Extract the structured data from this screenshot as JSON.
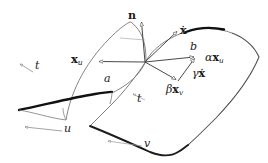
{
  "figure": {
    "kind": "geometry-diagram",
    "background_color": "#ffffff",
    "ink_color": "#1a1a1a",
    "thin_stroke_color": "#555555",
    "bold_curve_color": "#000000"
  },
  "labels": {
    "normal": "n",
    "xdot": "x",
    "xdot_accent": "·",
    "x_u": "x",
    "x_u_sub": "u",
    "curve_a": "a",
    "curve_b": "b",
    "param_t_left": "t",
    "param_t_right": "t",
    "param_u": "u",
    "param_v": "v",
    "alpha_symbol": "α",
    "alpha_vec": "x",
    "alpha_vec_sub": "u",
    "beta_symbol": "β",
    "beta_vec": "x",
    "beta_vec_sub": "v",
    "gamma_symbol": "γ",
    "gamma_vec": "x"
  },
  "geometry": {
    "origin": {
      "x": 145,
      "y": 62
    },
    "vectors": [
      {
        "name": "normal-vector-n",
        "label": "n",
        "from": [
          145,
          62
        ],
        "to": [
          141,
          20
        ]
      },
      {
        "name": "xdot-vector",
        "label": "x-dot",
        "from": [
          145,
          62
        ],
        "to": [
          178,
          30
        ]
      },
      {
        "name": "xu-vector",
        "label": "x_u",
        "from": [
          145,
          62
        ],
        "to": [
          98,
          62
        ]
      },
      {
        "name": "alpha-xu-vector",
        "label": "alpha x_u",
        "from": [
          145,
          62
        ],
        "to": [
          196,
          57
        ]
      },
      {
        "name": "beta-xv-vector",
        "label": "beta x_v",
        "from": [
          145,
          62
        ],
        "to": [
          178,
          81
        ]
      },
      {
        "name": "gamma-xdot-vector",
        "label": "gamma x-dot",
        "from": [
          178,
          81
        ],
        "to": [
          196,
          57
        ]
      }
    ],
    "patches": [
      {
        "name": "left-patch",
        "bold_edge": "curve-a"
      },
      {
        "name": "right-patch",
        "bold_edge": "curve-b"
      }
    ],
    "param_arrows": [
      {
        "name": "t-arrow-left",
        "label": "t",
        "direction": "up-left"
      },
      {
        "name": "u-arrow",
        "label": "u",
        "direction": "left"
      },
      {
        "name": "t-arrow-right",
        "label": "t",
        "direction": "up-left"
      },
      {
        "name": "v-arrow",
        "label": "v",
        "direction": "left"
      }
    ]
  }
}
